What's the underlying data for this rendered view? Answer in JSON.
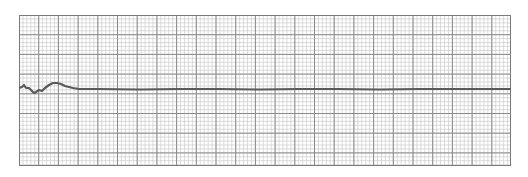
{
  "strip": {
    "description": "ECG rhythm strip on grid paper showing near-flat trace",
    "grid": {
      "x": 19,
      "y": 15,
      "width": 492,
      "height": 151,
      "major_spacing": 19.7,
      "minor_per_major": 5,
      "major_color": "#8a8a8a",
      "minor_color": "#c4c4c4",
      "border_color": "#7a7a7a"
    },
    "trace": {
      "color": "#5a5a5a",
      "width": 2.2,
      "baseline_y": 74,
      "points": [
        [
          0,
          73
        ],
        [
          3,
          72
        ],
        [
          5,
          70
        ],
        [
          7,
          73
        ],
        [
          10,
          73
        ],
        [
          12,
          75
        ],
        [
          15,
          78
        ],
        [
          17,
          77
        ],
        [
          20,
          75
        ],
        [
          23,
          76
        ],
        [
          26,
          73
        ],
        [
          30,
          70
        ],
        [
          34,
          68
        ],
        [
          38,
          68
        ],
        [
          42,
          69
        ],
        [
          46,
          71
        ],
        [
          50,
          72
        ],
        [
          54,
          73
        ],
        [
          60,
          74
        ],
        [
          80,
          74
        ],
        [
          120,
          74.5
        ],
        [
          160,
          74
        ],
        [
          200,
          74
        ],
        [
          240,
          74.5
        ],
        [
          280,
          74
        ],
        [
          320,
          74
        ],
        [
          360,
          74.5
        ],
        [
          400,
          74
        ],
        [
          440,
          74
        ],
        [
          492,
          74
        ]
      ]
    }
  }
}
